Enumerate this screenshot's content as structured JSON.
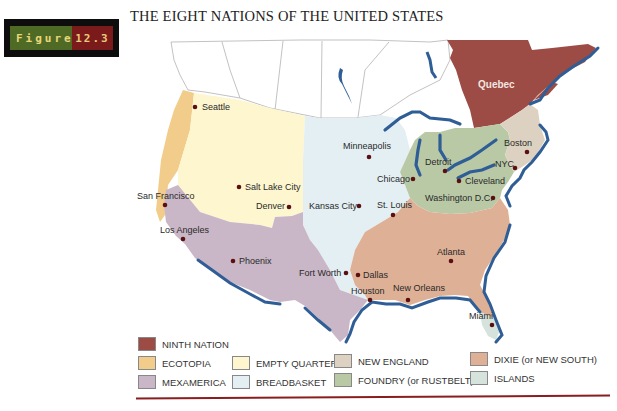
{
  "figure": {
    "word": "Figure",
    "number": "12.3"
  },
  "title": "THE EIGHT NATIONS OF THE UNITED STATES",
  "colors": {
    "ninth_nation": "#9c4b45",
    "ecotopia": "#f2cc8a",
    "mexamerica": "#c9b6c6",
    "empty_quarter": "#fdf6cf",
    "breadbasket": "#e4eff3",
    "new_england": "#ddd1c1",
    "foundry": "#b9c9a6",
    "dixie": "#deb095",
    "islands": "#d6e3dc",
    "water": "#2f5d96",
    "border": "#9a9a9a",
    "city_dot": "#5a1010",
    "rule": "#8a1d1d"
  },
  "map": {
    "region_labels": {
      "quebec": "Quebec"
    },
    "cities": [
      {
        "name": "Seattle",
        "x": 195,
        "y": 107,
        "lx": 202,
        "ly": 110,
        "anchor": "start"
      },
      {
        "name": "San Francisco",
        "x": 165,
        "y": 205,
        "lx": 137,
        "ly": 199,
        "anchor": "start"
      },
      {
        "name": "Salt Lake City",
        "x": 239,
        "y": 187,
        "lx": 245,
        "ly": 190,
        "anchor": "start"
      },
      {
        "name": "Denver",
        "x": 289,
        "y": 207,
        "lx": 256,
        "ly": 208,
        "anchor": "start"
      },
      {
        "name": "Los Angeles",
        "x": 183,
        "y": 239,
        "lx": 160,
        "ly": 233,
        "anchor": "start"
      },
      {
        "name": "Phoenix",
        "x": 233,
        "y": 261,
        "lx": 239,
        "ly": 264,
        "anchor": "start"
      },
      {
        "name": "Kansas City",
        "x": 359,
        "y": 206,
        "lx": 309,
        "ly": 208,
        "anchor": "start"
      },
      {
        "name": "Minneapolis",
        "x": 369,
        "y": 157,
        "lx": 343,
        "ly": 149,
        "anchor": "start"
      },
      {
        "name": "Chicago",
        "x": 413,
        "y": 179,
        "lx": 377,
        "ly": 182,
        "anchor": "start"
      },
      {
        "name": "St. Louis",
        "x": 393,
        "y": 215,
        "lx": 377,
        "ly": 208,
        "anchor": "start"
      },
      {
        "name": "Detroit",
        "x": 445,
        "y": 171,
        "lx": 425,
        "ly": 165,
        "anchor": "start"
      },
      {
        "name": "Cleveland",
        "x": 459,
        "y": 181,
        "lx": 465,
        "ly": 184,
        "anchor": "start"
      },
      {
        "name": "Washington D.C.",
        "x": 493,
        "y": 198,
        "lx": 425,
        "ly": 201,
        "anchor": "start"
      },
      {
        "name": "NYC",
        "x": 515,
        "y": 168,
        "lx": 495,
        "ly": 167,
        "anchor": "start"
      },
      {
        "name": "Boston",
        "x": 527,
        "y": 152,
        "lx": 504,
        "ly": 146,
        "anchor": "start"
      },
      {
        "name": "Fort Worth",
        "x": 346,
        "y": 273,
        "lx": 299,
        "ly": 276,
        "anchor": "start"
      },
      {
        "name": "Dallas",
        "x": 358,
        "y": 275,
        "lx": 363,
        "ly": 277,
        "anchor": "start"
      },
      {
        "name": "Houston",
        "x": 370,
        "y": 300,
        "lx": 351,
        "ly": 294,
        "anchor": "start"
      },
      {
        "name": "New Orleans",
        "x": 408,
        "y": 300,
        "lx": 393,
        "ly": 291,
        "anchor": "start"
      },
      {
        "name": "Atlanta",
        "x": 451,
        "y": 261,
        "lx": 437,
        "ly": 255,
        "anchor": "start"
      },
      {
        "name": "Miami",
        "x": 492,
        "y": 325,
        "lx": 469,
        "ly": 319,
        "anchor": "start"
      }
    ]
  },
  "legend": {
    "items": [
      {
        "key": "ninth_nation",
        "label": "NINTH NATION"
      },
      {
        "key": "ecotopia",
        "label": "ECOTOPIA"
      },
      {
        "key": "mexamerica",
        "label": "MEXAMERICA"
      },
      {
        "key": "empty_quarter",
        "label": "EMPTY QUARTER"
      },
      {
        "key": "breadbasket",
        "label": "BREADBASKET"
      },
      {
        "key": "new_england",
        "label": "NEW ENGLAND"
      },
      {
        "key": "foundry",
        "label": "FOUNDRY (or RUSTBELT)"
      },
      {
        "key": "dixie",
        "label": "DIXIE (or NEW SOUTH)"
      },
      {
        "key": "islands",
        "label": "ISLANDS"
      }
    ]
  }
}
